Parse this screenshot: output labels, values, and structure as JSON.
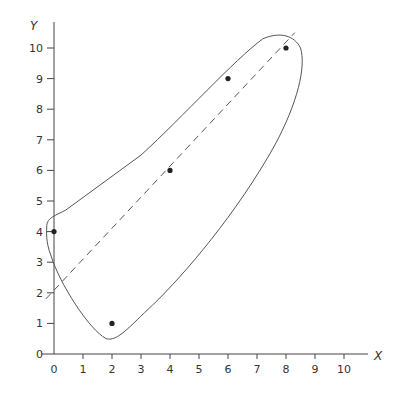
{
  "chart_data": {
    "type": "scatter",
    "title": "",
    "xlabel": "X",
    "ylabel": "Y",
    "xlim": [
      0,
      10.7
    ],
    "ylim": [
      0,
      10.7
    ],
    "x_ticks": [
      0,
      1,
      2,
      3,
      4,
      5,
      6,
      7,
      8,
      9,
      10
    ],
    "y_ticks": [
      0,
      1,
      2,
      3,
      4,
      5,
      6,
      7,
      8,
      9,
      10
    ],
    "grid": false,
    "series": [
      {
        "name": "points",
        "x": [
          0,
          2,
          4,
          6,
          8
        ],
        "y": [
          4,
          1,
          6,
          9,
          10
        ]
      }
    ],
    "annotations": [
      {
        "type": "dashed-line",
        "name": "regression line",
        "from": [
          0,
          2
        ],
        "to": [
          8.3,
          10.5
        ]
      },
      {
        "type": "closed-curve",
        "name": "enclosing ellipse-like outline"
      }
    ]
  },
  "style": {
    "line_color": "#555555",
    "point_color": "#222222",
    "axis_color": "#444444"
  }
}
